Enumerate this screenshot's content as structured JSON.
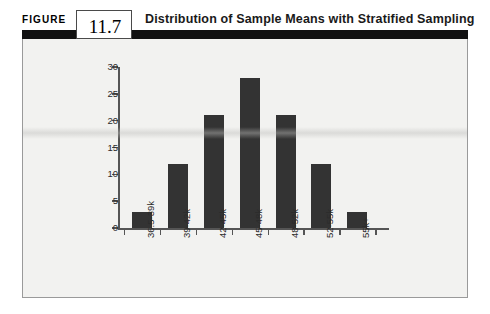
{
  "figure": {
    "label": "FIGURE",
    "number": "11.7",
    "title": "Distribution of Sample Means with Stratified Sampling"
  },
  "colors": {
    "bar": "#333333",
    "rule": "#111111",
    "panel_bg": "#f2f2f0",
    "axis": "#555555",
    "panel_border": "#9a9a9a"
  },
  "chart_data": {
    "type": "bar",
    "title": "Distribution of Sample Means with Stratified Sampling",
    "categories": [
      "36.5-39k",
      "39-42k",
      "42-45k",
      "45-48k",
      "48-52k",
      "52-55k",
      "55k+"
    ],
    "values": [
      3,
      12,
      21,
      28,
      21,
      12,
      3
    ],
    "xlabel": "",
    "ylabel": "",
    "ylim": [
      0,
      30
    ],
    "yticks": [
      0,
      5,
      10,
      15,
      20,
      25,
      30
    ],
    "ytick_labels": [
      "0",
      "5",
      "10",
      "15",
      "20",
      "25",
      "30"
    ],
    "grid": false,
    "legend": false
  }
}
